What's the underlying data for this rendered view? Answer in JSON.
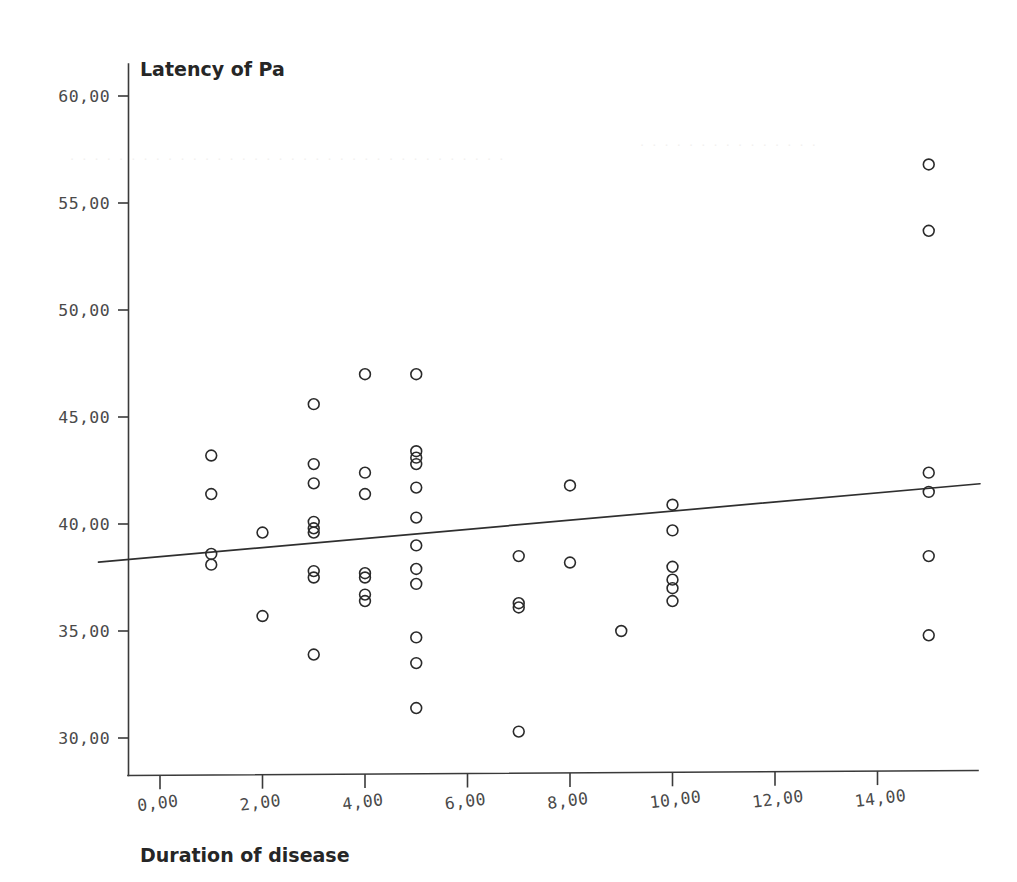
{
  "chart_data": {
    "type": "scatter",
    "title": "",
    "ylabel": "Latency of Pa",
    "xlabel": "Duration of disease",
    "xlim": [
      -1.2,
      16.0
    ],
    "ylim": [
      28.8,
      61.0
    ],
    "grid": false,
    "legend": "none",
    "xticks": [
      0,
      2,
      4,
      6,
      8,
      10,
      12,
      14
    ],
    "xtick_labels": [
      "0,00",
      "2,00",
      "4,00",
      "6,00",
      "8,00",
      "10,00",
      "12,00",
      "14,00"
    ],
    "yticks": [
      30,
      35,
      40,
      45,
      50,
      55,
      60
    ],
    "ytick_labels": [
      "30,00",
      "35,00",
      "40,00",
      "45,00",
      "50,00",
      "55,00",
      "60,00"
    ],
    "marker": "open-circle",
    "marker_color": "#2a2a2a",
    "points": [
      {
        "x": 1,
        "y": 43.2
      },
      {
        "x": 1,
        "y": 41.4
      },
      {
        "x": 1,
        "y": 38.6
      },
      {
        "x": 1,
        "y": 38.1
      },
      {
        "x": 2,
        "y": 39.6
      },
      {
        "x": 2,
        "y": 35.7
      },
      {
        "x": 3,
        "y": 45.6
      },
      {
        "x": 3,
        "y": 42.8
      },
      {
        "x": 3,
        "y": 41.9
      },
      {
        "x": 3,
        "y": 40.1
      },
      {
        "x": 3,
        "y": 39.8
      },
      {
        "x": 3,
        "y": 39.6
      },
      {
        "x": 3,
        "y": 37.8
      },
      {
        "x": 3,
        "y": 37.5
      },
      {
        "x": 3,
        "y": 33.9
      },
      {
        "x": 4,
        "y": 47.0
      },
      {
        "x": 4,
        "y": 42.4
      },
      {
        "x": 4,
        "y": 41.4
      },
      {
        "x": 4,
        "y": 37.7
      },
      {
        "x": 4,
        "y": 37.5
      },
      {
        "x": 4,
        "y": 36.7
      },
      {
        "x": 4,
        "y": 36.4
      },
      {
        "x": 5,
        "y": 47.0
      },
      {
        "x": 5,
        "y": 43.4
      },
      {
        "x": 5,
        "y": 43.1
      },
      {
        "x": 5,
        "y": 42.8
      },
      {
        "x": 5,
        "y": 41.7
      },
      {
        "x": 5,
        "y": 40.3
      },
      {
        "x": 5,
        "y": 39.0
      },
      {
        "x": 5,
        "y": 37.9
      },
      {
        "x": 5,
        "y": 37.2
      },
      {
        "x": 5,
        "y": 34.7
      },
      {
        "x": 5,
        "y": 33.5
      },
      {
        "x": 5,
        "y": 31.4
      },
      {
        "x": 7,
        "y": 38.5
      },
      {
        "x": 7,
        "y": 36.3
      },
      {
        "x": 7,
        "y": 36.1
      },
      {
        "x": 7,
        "y": 30.3
      },
      {
        "x": 8,
        "y": 41.8
      },
      {
        "x": 8,
        "y": 38.2
      },
      {
        "x": 9,
        "y": 35.0
      },
      {
        "x": 10,
        "y": 40.9
      },
      {
        "x": 10,
        "y": 39.7
      },
      {
        "x": 10,
        "y": 38.0
      },
      {
        "x": 10,
        "y": 37.4
      },
      {
        "x": 10,
        "y": 37.0
      },
      {
        "x": 10,
        "y": 36.4
      },
      {
        "x": 15,
        "y": 56.8
      },
      {
        "x": 15,
        "y": 53.7
      },
      {
        "x": 15,
        "y": 42.4
      },
      {
        "x": 15,
        "y": 41.5
      },
      {
        "x": 15,
        "y": 38.5
      },
      {
        "x": 15,
        "y": 34.8
      }
    ],
    "fit_line": {
      "type": "linear-regression",
      "x_start": -1.2,
      "y_start": 38.22,
      "x_end": 16.0,
      "y_end": 41.88
    }
  },
  "labels": {
    "y_axis_title": "Latency of Pa",
    "x_axis_title": "Duration of disease"
  }
}
